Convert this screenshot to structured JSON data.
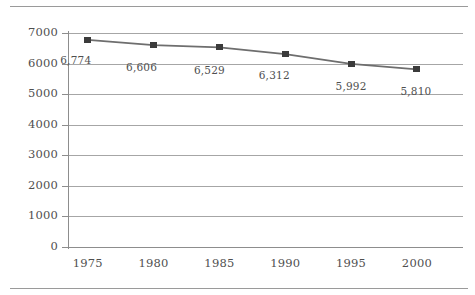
{
  "chart_data": {
    "type": "line",
    "title": "",
    "subtitle": "",
    "xlabel": "",
    "ylabel": "",
    "categories": [
      "1975",
      "1980",
      "1985",
      "1990",
      "1995",
      "2000"
    ],
    "x": [
      1975,
      1980,
      1985,
      1990,
      1995,
      2000
    ],
    "values": [
      6774,
      6606,
      6529,
      6312,
      5992,
      5810
    ],
    "point_labels": [
      "6,774",
      "6,606",
      "6,529",
      "6,312",
      "5,992",
      "5,810"
    ],
    "ylim": [
      0,
      7000
    ],
    "ytick_values": [
      7000,
      6000,
      5000,
      4000,
      3000,
      2000,
      1000,
      0
    ],
    "ytick_labels": [
      "7000",
      "6000",
      "5000",
      "4000",
      "3000",
      "2000",
      "1000",
      "0"
    ],
    "xtick_labels": [
      "1975",
      "1980",
      "1985",
      "1990",
      "1995",
      "2000"
    ],
    "grid": "horizontal",
    "legend": "none",
    "series": [
      {
        "name": "",
        "values": [
          6774,
          6606,
          6529,
          6312,
          5992,
          5810
        ],
        "marker": "square",
        "marker_color": "#3b3b3b",
        "line_color": "#6e6e6e"
      }
    ],
    "colors": {
      "line": "#6e6e6e",
      "marker": "#3b3b3b",
      "grid": "#a6a6a6",
      "axis": "#8d8d8d",
      "text": "#4f4f4f",
      "rule": "#9a9a9a",
      "background": "#ffffff"
    },
    "point_label_offsets": [
      {
        "dx": -12,
        "dy": 14
      },
      {
        "dx": -12,
        "dy": 16
      },
      {
        "dx": -10,
        "dy": 17
      },
      {
        "dx": -11,
        "dy": 15
      },
      {
        "dx": 0,
        "dy": 16
      },
      {
        "dx": -1,
        "dy": 16
      }
    ]
  }
}
